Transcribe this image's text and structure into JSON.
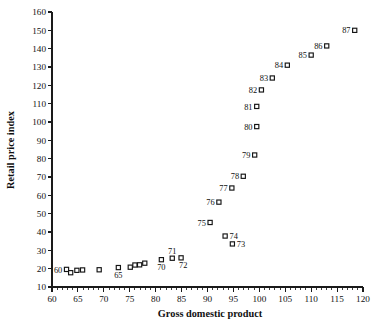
{
  "chart_data": {
    "type": "scatter",
    "title": "",
    "xlabel": "Gross domestic product",
    "ylabel": "Retail price index",
    "xlim": [
      60,
      120
    ],
    "ylim": [
      10,
      160
    ],
    "xticks": [
      60,
      65,
      70,
      75,
      80,
      85,
      90,
      95,
      100,
      105,
      110,
      115,
      120
    ],
    "yticks": [
      10,
      20,
      30,
      40,
      50,
      60,
      70,
      80,
      90,
      100,
      110,
      120,
      130,
      140,
      150,
      160
    ],
    "xtick_minor_step": 1,
    "grid": false,
    "legend": null,
    "marker_style": "open-square",
    "points": [
      {
        "label": "60",
        "x": 62.8,
        "y": 19.6,
        "label_pos": "left"
      },
      {
        "label": "61",
        "x": 63.6,
        "y": 17.8,
        "label_pos": "none"
      },
      {
        "label": "62",
        "x": 64.8,
        "y": 19.1,
        "label_pos": "none"
      },
      {
        "label": "63",
        "x": 65.9,
        "y": 19.3,
        "label_pos": "none"
      },
      {
        "label": "64",
        "x": 69.1,
        "y": 19.4,
        "label_pos": "none"
      },
      {
        "label": "65",
        "x": 72.8,
        "y": 20.6,
        "label_pos": "below"
      },
      {
        "label": "66",
        "x": 75.1,
        "y": 20.8,
        "label_pos": "none"
      },
      {
        "label": "67",
        "x": 76.0,
        "y": 22.0,
        "label_pos": "none"
      },
      {
        "label": "68",
        "x": 76.9,
        "y": 22.1,
        "label_pos": "none"
      },
      {
        "label": "69",
        "x": 77.9,
        "y": 23.0,
        "label_pos": "none"
      },
      {
        "label": "70",
        "x": 81.1,
        "y": 24.9,
        "label_pos": "below"
      },
      {
        "label": "71",
        "x": 83.2,
        "y": 25.7,
        "label_pos": "above"
      },
      {
        "label": "72",
        "x": 84.9,
        "y": 25.9,
        "label_pos": "below-right"
      },
      {
        "label": "73",
        "x": 94.8,
        "y": 33.5,
        "label_pos": "right"
      },
      {
        "label": "74",
        "x": 93.4,
        "y": 37.8,
        "label_pos": "right"
      },
      {
        "label": "75",
        "x": 90.5,
        "y": 45.2,
        "label_pos": "left"
      },
      {
        "label": "76",
        "x": 92.2,
        "y": 56.3,
        "label_pos": "left"
      },
      {
        "label": "77",
        "x": 94.7,
        "y": 64.0,
        "label_pos": "left"
      },
      {
        "label": "78",
        "x": 96.9,
        "y": 70.4,
        "label_pos": "left"
      },
      {
        "label": "79",
        "x": 99.1,
        "y": 82.0,
        "label_pos": "left"
      },
      {
        "label": "80",
        "x": 99.5,
        "y": 97.5,
        "label_pos": "left"
      },
      {
        "label": "81",
        "x": 99.5,
        "y": 108.5,
        "label_pos": "left"
      },
      {
        "label": "82",
        "x": 100.4,
        "y": 117.5,
        "label_pos": "left"
      },
      {
        "label": "83",
        "x": 102.5,
        "y": 124.0,
        "label_pos": "left"
      },
      {
        "label": "84",
        "x": 105.4,
        "y": 131.0,
        "label_pos": "left"
      },
      {
        "label": "85",
        "x": 110.0,
        "y": 136.5,
        "label_pos": "left"
      },
      {
        "label": "86",
        "x": 113.0,
        "y": 141.5,
        "label_pos": "left"
      },
      {
        "label": "87",
        "x": 118.4,
        "y": 150.0,
        "label_pos": "left"
      }
    ]
  }
}
